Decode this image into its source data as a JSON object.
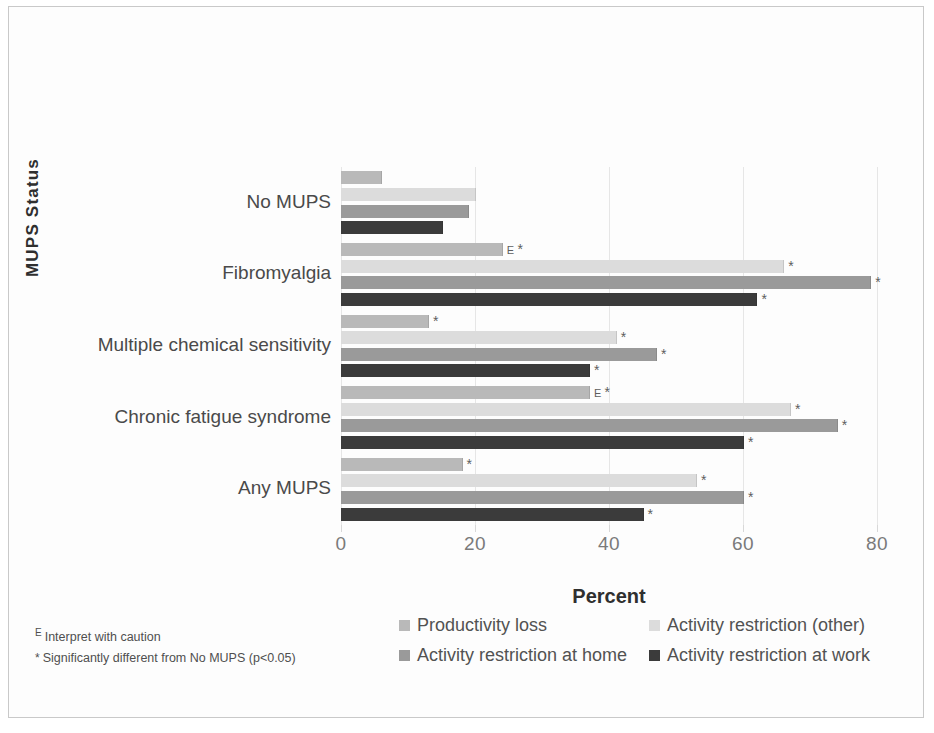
{
  "chart_data": {
    "type": "bar",
    "orientation": "horizontal",
    "title": "",
    "xlabel": "Percent",
    "ylabel": "MUPS Status",
    "xlim": [
      0,
      80
    ],
    "xticks": [
      0,
      20,
      40,
      60,
      80
    ],
    "xtick_labels": [
      "0",
      "20",
      "40",
      "60",
      "80"
    ],
    "grid": true,
    "legend_position": "bottom",
    "categories": [
      "No MUPS",
      "Fibromyalgia",
      "Multiple chemical sensitivity",
      "Chronic fatigue syndrome",
      "Any MUPS"
    ],
    "series": [
      {
        "name": "Productivity loss",
        "color": "#b9b9b9",
        "values": [
          6,
          24,
          13,
          37,
          18
        ]
      },
      {
        "name": "Activity restriction (other)",
        "color": "#dcdcdc",
        "values": [
          20,
          66,
          41,
          67,
          53
        ]
      },
      {
        "name": "Activity restriction at home",
        "color": "#9a9a9a",
        "values": [
          19,
          79,
          47,
          74,
          60
        ]
      },
      {
        "name": "Activity restriction at work",
        "color": "#3b3b3b",
        "values": [
          15,
          62,
          37,
          60,
          45
        ]
      }
    ],
    "annotations": {
      "significance_marker": "*",
      "caution_marker": "E",
      "significant_cells": [
        {
          "category": "Fibromyalgia",
          "series": "Productivity loss"
        },
        {
          "category": "Fibromyalgia",
          "series": "Activity restriction (other)"
        },
        {
          "category": "Fibromyalgia",
          "series": "Activity restriction at home"
        },
        {
          "category": "Fibromyalgia",
          "series": "Activity restriction at work"
        },
        {
          "category": "Multiple chemical sensitivity",
          "series": "Productivity loss"
        },
        {
          "category": "Multiple chemical sensitivity",
          "series": "Activity restriction (other)"
        },
        {
          "category": "Multiple chemical sensitivity",
          "series": "Activity restriction at home"
        },
        {
          "category": "Multiple chemical sensitivity",
          "series": "Activity restriction at work"
        },
        {
          "category": "Chronic fatigue syndrome",
          "series": "Productivity loss"
        },
        {
          "category": "Chronic fatigue syndrome",
          "series": "Activity restriction (other)"
        },
        {
          "category": "Chronic fatigue syndrome",
          "series": "Activity restriction at home"
        },
        {
          "category": "Chronic fatigue syndrome",
          "series": "Activity restriction at work"
        },
        {
          "category": "Any MUPS",
          "series": "Productivity loss"
        },
        {
          "category": "Any MUPS",
          "series": "Activity restriction (other)"
        },
        {
          "category": "Any MUPS",
          "series": "Activity restriction at home"
        },
        {
          "category": "Any MUPS",
          "series": "Activity restriction at work"
        }
      ],
      "caution_cells": [
        {
          "category": "Fibromyalgia",
          "series": "Productivity loss"
        },
        {
          "category": "Chronic fatigue syndrome",
          "series": "Productivity loss"
        }
      ]
    }
  },
  "axis": {
    "y_title": "MUPS Status",
    "x_title": "Percent"
  },
  "legend": {
    "items": [
      {
        "label": "Productivity loss",
        "color": "#b9b9b9"
      },
      {
        "label": "Activity restriction (other)",
        "color": "#dcdcdc"
      },
      {
        "label": "Activity restriction at home",
        "color": "#9a9a9a"
      },
      {
        "label": "Activity restriction at work",
        "color": "#3b3b3b"
      }
    ]
  },
  "footnotes": [
    {
      "marker": "E",
      "text": "Interpret with caution"
    },
    {
      "marker": "*",
      "text": "Significantly different from No MUPS (p<0.05)"
    }
  ]
}
